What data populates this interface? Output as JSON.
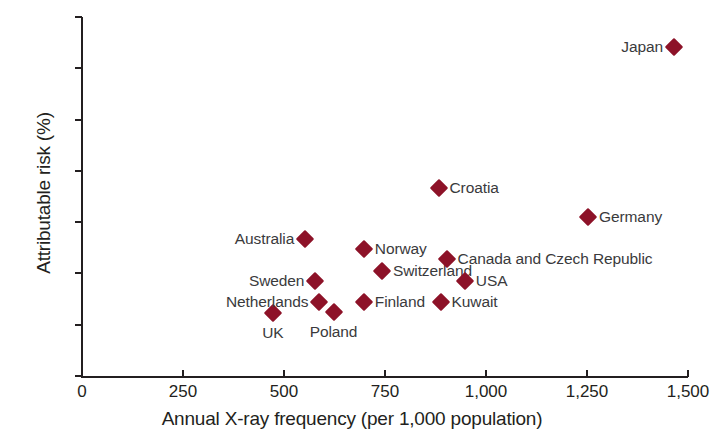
{
  "chart_data": {
    "type": "scatter",
    "title": "",
    "xlabel": "Annual X-ray frequency (per 1,000 population)",
    "ylabel": "Attributable risk (%)",
    "xlim": [
      0,
      1500
    ],
    "ylim": [
      0,
      3.5
    ],
    "xticks": [
      "0",
      "250",
      "500",
      "750",
      "1,000",
      "1,250",
      "1,500"
    ],
    "xtick_values": [
      0,
      250,
      500,
      750,
      1000,
      1250,
      1500
    ],
    "yticks": [
      "0",
      "0.5",
      "1.0",
      "1.5",
      "2.0",
      "2.5",
      "3.0",
      "3.5"
    ],
    "ytick_values": [
      0,
      0.5,
      1.0,
      1.5,
      2.0,
      2.5,
      3.0,
      3.5
    ],
    "grid": false,
    "legend": "none",
    "marker": "diamond",
    "marker_color": "#8d1228",
    "points": [
      {
        "label": "UK",
        "x": 475,
        "y": 0.61,
        "label_pos": "below"
      },
      {
        "label": "Netherlands",
        "x": 590,
        "y": 0.72,
        "label_pos": "left"
      },
      {
        "label": "Sweden",
        "x": 580,
        "y": 0.93,
        "label_pos": "left"
      },
      {
        "label": "Australia",
        "x": 555,
        "y": 1.34,
        "label_pos": "left"
      },
      {
        "label": "Poland",
        "x": 625,
        "y": 0.62,
        "label_pos": "below"
      },
      {
        "label": "Finland",
        "x": 700,
        "y": 0.72,
        "label_pos": "right"
      },
      {
        "label": "Norway",
        "x": 700,
        "y": 1.24,
        "label_pos": "right"
      },
      {
        "label": "Switzerland",
        "x": 745,
        "y": 1.02,
        "label_pos": "right"
      },
      {
        "label": "Kuwait",
        "x": 890,
        "y": 0.72,
        "label_pos": "right"
      },
      {
        "label": "Croatia",
        "x": 885,
        "y": 1.83,
        "label_pos": "right"
      },
      {
        "label": "Canada and Czech Republic",
        "x": 905,
        "y": 1.14,
        "label_pos": "right"
      },
      {
        "label": "USA",
        "x": 950,
        "y": 0.93,
        "label_pos": "right"
      },
      {
        "label": "Germany",
        "x": 1255,
        "y": 1.55,
        "label_pos": "right"
      },
      {
        "label": "Japan",
        "x": 1468,
        "y": 3.21,
        "label_pos": "left"
      }
    ]
  }
}
